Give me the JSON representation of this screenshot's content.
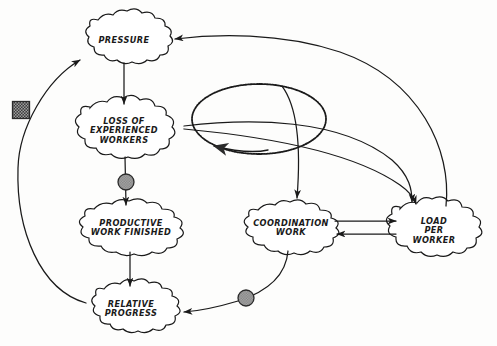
{
  "diagram": {
    "style": "hand-drawn cloud nodes with curved causal arrows",
    "background_color": "#fdfdfc",
    "ink_color": "#1a1a1a",
    "nodes": [
      {
        "id": "pressure",
        "label": "PRESSURE",
        "cx": 124,
        "cy": 41,
        "rx": 46,
        "ry": 22
      },
      {
        "id": "loss",
        "label": "LOSS OF\nEXPERIENCED\nWORKERS",
        "cx": 124,
        "cy": 131,
        "rx": 54,
        "ry": 26
      },
      {
        "id": "productive",
        "label": "PRODUCTIVE\nWORK FINISHED",
        "cx": 131,
        "cy": 228,
        "rx": 57,
        "ry": 24
      },
      {
        "id": "relative",
        "label": "RELATIVE\nPROGRESS",
        "cx": 131,
        "cy": 309,
        "rx": 48,
        "ry": 22
      },
      {
        "id": "coordination",
        "label": "COORDINATION\nWORK",
        "cx": 291,
        "cy": 228,
        "rx": 52,
        "ry": 22
      },
      {
        "id": "load",
        "label": "LOAD\nPER\nWORKER",
        "cx": 434,
        "cy": 231,
        "rx": 47,
        "ry": 26
      }
    ],
    "markers": [
      {
        "id": "delay-square",
        "kind": "hatched-square",
        "cx": 21,
        "cy": 110,
        "size": 17,
        "fill": "#4a4a4a"
      },
      {
        "id": "delay-circle-1",
        "kind": "hatched-circle",
        "cx": 126,
        "cy": 182,
        "r": 8,
        "fill": "#9a9a9a"
      },
      {
        "id": "delay-circle-2",
        "kind": "hatched-circle",
        "cx": 246,
        "cy": 298,
        "r": 8,
        "fill": "#9a9a9a"
      }
    ],
    "edges": [
      {
        "id": "pressure-to-loss",
        "from": "pressure",
        "to": "loss"
      },
      {
        "id": "loss-to-productive",
        "from": "loss",
        "to": "productive"
      },
      {
        "id": "productive-to-relative",
        "from": "productive",
        "to": "relative"
      },
      {
        "id": "relative-to-pressure",
        "from": "relative",
        "to": "pressure"
      },
      {
        "id": "loss-to-load",
        "from": "loss",
        "to": "load"
      },
      {
        "id": "loss-to-load-secondary",
        "from": "loss",
        "to": "load"
      },
      {
        "id": "load-to-pressure",
        "from": "load",
        "to": "pressure"
      },
      {
        "id": "loop-to-loss",
        "from": "feedback-loop",
        "to": "loss"
      },
      {
        "id": "loop-to-coordination",
        "from": "feedback-loop",
        "to": "coordination"
      },
      {
        "id": "coordination-to-load",
        "from": "coordination",
        "to": "load"
      },
      {
        "id": "load-to-coordination",
        "from": "load",
        "to": "coordination"
      },
      {
        "id": "coordination-to-relative",
        "from": "coordination",
        "to": "relative"
      }
    ],
    "feedback_loop": {
      "id": "feedback-loop",
      "cx": 259,
      "cy": 119,
      "rx": 67,
      "ry": 35
    }
  }
}
